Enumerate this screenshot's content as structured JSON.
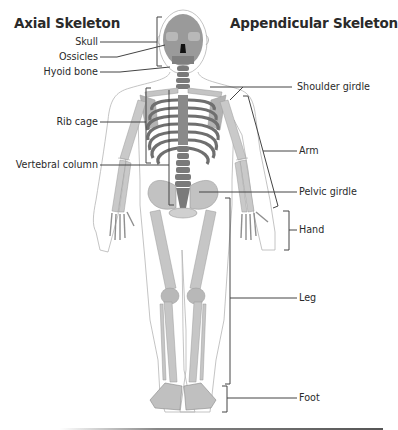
{
  "diagram": {
    "titles": {
      "axial": "Axial Skeleton",
      "appendicular": "Appendicular Skeleton"
    },
    "axial_labels": [
      {
        "id": "skull",
        "text": "Skull"
      },
      {
        "id": "ossicles",
        "text": "Ossicles"
      },
      {
        "id": "hyoid",
        "text": "Hyoid bone"
      },
      {
        "id": "ribcage",
        "text": "Rib cage"
      },
      {
        "id": "vertebral",
        "text": "Vertebral column"
      }
    ],
    "appendicular_labels": [
      {
        "id": "shoulder",
        "text": "Shoulder girdle"
      },
      {
        "id": "arm",
        "text": "Arm"
      },
      {
        "id": "pelvic",
        "text": "Pelvic girdle"
      },
      {
        "id": "hand",
        "text": "Hand"
      },
      {
        "id": "leg",
        "text": "Leg"
      },
      {
        "id": "foot",
        "text": "Foot"
      }
    ],
    "colors": {
      "bone": "#c9c9c9",
      "bone_dark": "#7a7a7a",
      "outline": "#b0b0b0",
      "leader": "#444444",
      "text": "#2a2a2a"
    }
  }
}
